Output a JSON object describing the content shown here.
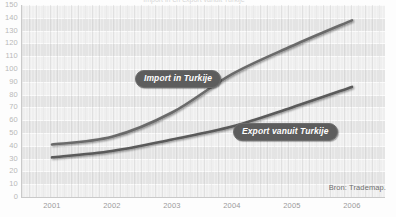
{
  "figure": {
    "title_cutoff": "Import in en export vanuit Turkije",
    "source_note": "Bron: Trademap."
  },
  "axes": {
    "y_ticks": [
      "150",
      "140",
      "130",
      "120",
      "110",
      "100",
      "90",
      "80",
      "70",
      "60",
      "50",
      "40",
      "30",
      "20",
      "10",
      "0"
    ],
    "x_ticks": [
      "2001",
      "2002",
      "2003",
      "2004",
      "2005",
      "2006"
    ]
  },
  "annotations": {
    "import_label": "Import in Turkije",
    "export_label": "Export vanuit Turkije"
  },
  "colors": {
    "plot_background": "#e9e9e9",
    "band_light": "#efefef",
    "band_dark": "#e4e4e4",
    "gridline": "#fafafa",
    "line_import": "#6b6b6b",
    "line_export": "#5a5a5a",
    "pill_background": "#5d5d5d",
    "pill_text": "#ffffff",
    "tick_text": "#9a9a9a",
    "source_text": "#6f6f6f"
  },
  "chart_data": {
    "type": "line",
    "title": "Import in en export vanuit Turkije",
    "xlabel": "",
    "ylabel": "",
    "x": [
      2001,
      2002,
      2003,
      2004,
      2005,
      2006
    ],
    "categories": [
      "2001",
      "2002",
      "2003",
      "2004",
      "2005",
      "2006"
    ],
    "ylim": [
      0,
      150
    ],
    "ytick_step": 10,
    "grid": true,
    "legend_position": "inline-annotations",
    "series": [
      {
        "name": "Import in Turkije",
        "values": [
          41,
          47,
          66,
          96,
          118,
          138
        ]
      },
      {
        "name": "Export vanuit Turkije",
        "values": [
          31,
          36,
          45,
          55,
          70,
          86
        ]
      }
    ],
    "annotations": [
      {
        "text": "Import in Turkije",
        "x": 2003,
        "y": 103
      },
      {
        "text": "Export vanuit Turkije",
        "x": 2004.6,
        "y": 60
      },
      {
        "text": "Bron: Trademap.",
        "x": 2006,
        "y": 8
      }
    ]
  }
}
